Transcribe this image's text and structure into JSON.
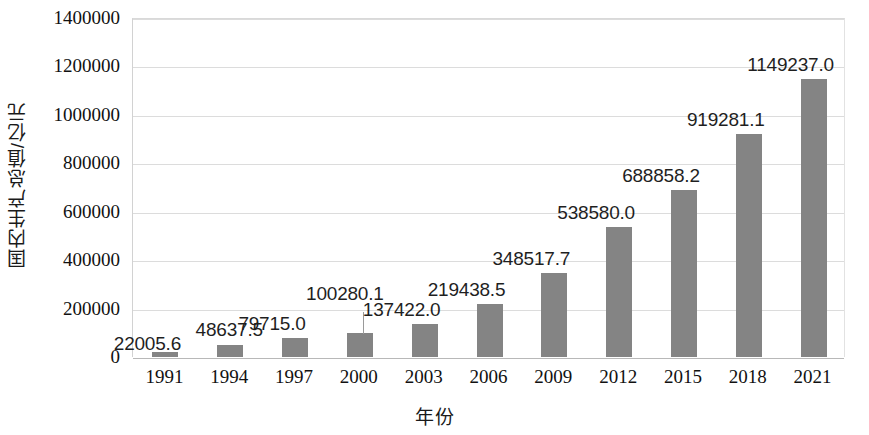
{
  "chart_data": {
    "type": "bar",
    "title": "",
    "xlabel": "年份",
    "ylabel": "国内生产总值/亿元",
    "categories": [
      "1991",
      "1994",
      "1997",
      "2000",
      "2003",
      "2006",
      "2009",
      "2012",
      "2015",
      "2018",
      "2021"
    ],
    "values": [
      22005.6,
      48637.5,
      79715.0,
      100280.1,
      137422.0,
      219438.5,
      348517.7,
      538580.0,
      688858.2,
      919281.1,
      1149237.0
    ],
    "data_labels": [
      "22005.6",
      "48637.5",
      "79715.0",
      "100280.1",
      "137422.0",
      "219438.5",
      "348517.7",
      "538580.0",
      "688858.2",
      "919281.1",
      "1149237.0"
    ],
    "ylim": [
      0,
      1400000
    ],
    "y_ticks": [
      0,
      200000,
      400000,
      600000,
      800000,
      1000000,
      1200000,
      1400000
    ],
    "y_tick_labels": [
      "0",
      "200000",
      "400000",
      "600000",
      "800000",
      "1000000",
      "1200000",
      "1400000"
    ],
    "grid": true,
    "legend": false,
    "legend_position": "none",
    "series_color": "#848484",
    "gridline_color": "#dcdcdc",
    "text_color": "#1f1f1f",
    "label_placement": [
      "left",
      "above",
      "above-left",
      "above-leader",
      "above-left",
      "above-left",
      "above-left",
      "above-left",
      "above-left",
      "above-left",
      "above-left"
    ]
  }
}
